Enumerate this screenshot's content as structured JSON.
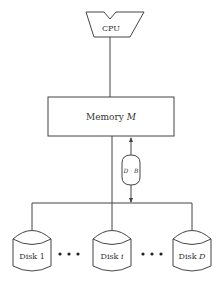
{
  "diagram": {
    "type": "parallel-disk-model",
    "cpu": {
      "label": "CPU"
    },
    "memory": {
      "label_prefix": "Memory ",
      "label_var": "M"
    },
    "block_transfer": {
      "label": "D · B"
    },
    "disks": [
      {
        "label_prefix": "Disk ",
        "label_var": "1",
        "italic": false
      },
      {
        "label_prefix": "Disk ",
        "label_var": "i",
        "italic": true
      },
      {
        "label_prefix": "Disk ",
        "label_var": "D",
        "italic": true
      }
    ],
    "ellipsis": "• • •",
    "colors": {
      "stroke": "#444444",
      "text": "#333333",
      "background": "#ffffff"
    }
  }
}
